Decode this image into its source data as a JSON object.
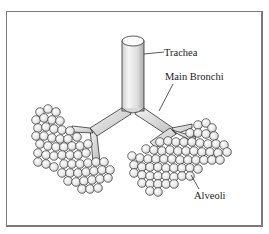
{
  "diagram": {
    "labels": {
      "trachea": "Trachea",
      "main_bronchi": "Main Bronchi",
      "alveoli": "Alveoli"
    },
    "colors": {
      "stroke": "#333333",
      "frame": "#7a7a7a",
      "tube_light": "#f4f4f4",
      "tube_shade": "#b8b8b8",
      "alveolus_fill": "#eeeeee"
    }
  }
}
